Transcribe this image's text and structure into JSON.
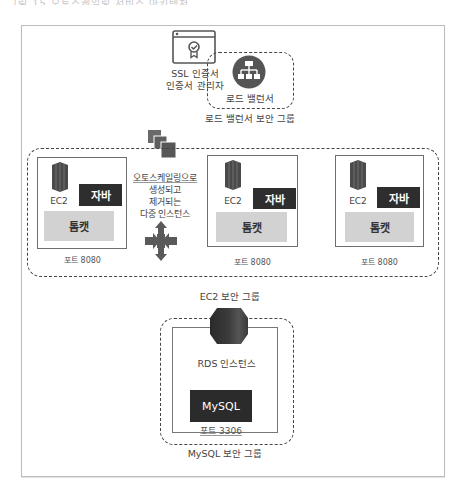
{
  "header": {
    "cropped_caption": "그림 15 오토스케일링 서비스 아키텍처"
  },
  "load_balancer_section": {
    "ssl_icon": "certificate-icon",
    "ssl_label_line1": "SSL 인증서",
    "ssl_label_line2": "인증서 관리자",
    "lb_icon": "load-balancer-icon",
    "lb_label": "로드 밸런서",
    "lb_group_label": "로드 밸런서 보안 그룹"
  },
  "ec2_group": {
    "autoscaling_icon": "autoscaling-group-icon",
    "autoscaling_text": [
      "오토스케일링으로",
      "생성되고",
      "제거되는",
      "다중 인스턴스"
    ],
    "scale_arrows_icon": "scale-arrows-icon",
    "group_label": "EC2 보안 그룹",
    "instances": [
      {
        "server_label": "EC2",
        "runtime": "자바",
        "app_server": "톰캣",
        "port": "포트 8080"
      },
      {
        "server_label": "EC2",
        "runtime": "자바",
        "app_server": "톰캣",
        "port": "포트 8080"
      },
      {
        "server_label": "EC2",
        "runtime": "자바",
        "app_server": "톰캣",
        "port": "포트 8080"
      }
    ]
  },
  "database_section": {
    "rds_icon": "rds-database-icon",
    "rds_label": "RDS 인스턴스",
    "engine": "MySQL",
    "port": "포트 3306",
    "group_label": "MySQL 보안 그룹"
  },
  "colors": {
    "dark": "#2e2e2e",
    "light_gray": "#d2d2d2",
    "border": "#444444",
    "icon_gray": "#5a5a5a"
  }
}
